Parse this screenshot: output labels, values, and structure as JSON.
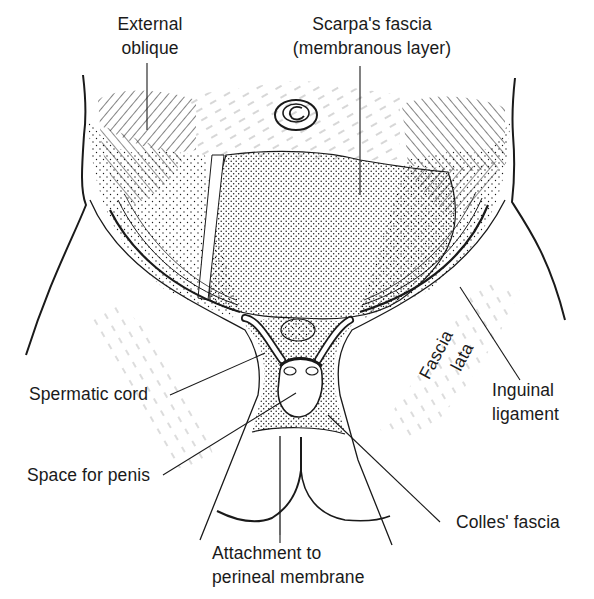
{
  "figure": {
    "colors": {
      "ink": "#1a1a1a",
      "background": "#ffffff"
    }
  },
  "labels": {
    "external_oblique": {
      "line1": "External",
      "line2": "oblique"
    },
    "scarpas_fascia": {
      "line1": "Scarpa's fascia",
      "line2": "(membranous layer)"
    },
    "fascia_lata": {
      "line1": "Fascia",
      "line2": "lata"
    },
    "inguinal_ligament": {
      "line1": "Inguinal",
      "line2": "ligament"
    },
    "spermatic_cord": {
      "text": "Spermatic cord"
    },
    "space_for_penis": {
      "text": "Space for penis"
    },
    "colles_fascia": {
      "text": "Colles' fascia"
    },
    "attachment": {
      "line1": "Attachment to",
      "line2": "perineal membrane"
    }
  }
}
